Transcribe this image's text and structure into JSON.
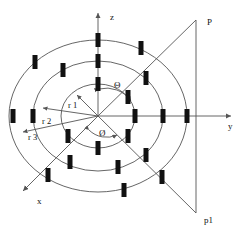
{
  "figure": {
    "background_color": "#ffffff",
    "line_color": "#555555",
    "axis_color": "#555555",
    "element_color": "#111111",
    "text_color": "#111111"
  },
  "origin": {
    "x": 98,
    "y": 116
  },
  "axes": [
    {
      "id": "z",
      "label": "z",
      "label_x": 110,
      "label_y": 17,
      "x1": 98,
      "y1": 116,
      "x2": 98,
      "y2": 12,
      "arrow": "up"
    },
    {
      "id": "y",
      "label": "y",
      "label_x": 228,
      "label_y": 128,
      "x1": 98,
      "y1": 116,
      "x2": 232,
      "y2": 116,
      "arrow": "right"
    },
    {
      "id": "x",
      "label": "x",
      "label_x": 38,
      "label_y": 203,
      "x1": 98,
      "y1": 116,
      "x2": 22,
      "y2": 192,
      "arrow": "down-left"
    }
  ],
  "rings": [
    {
      "id": "r1",
      "label": "r 1",
      "rx": 37,
      "ry": 32,
      "label_x": 68,
      "label_y": 107
    },
    {
      "id": "r2",
      "label": "r 2",
      "rx": 65,
      "ry": 55,
      "label_x": 44,
      "label_y": 123
    },
    {
      "id": "r3",
      "label": "r 3",
      "rx": 89,
      "ry": 76,
      "label_x": 30,
      "label_y": 136
    }
  ],
  "radius_arrows": [
    {
      "id": "r1-arrow",
      "x1": 98,
      "y1": 116,
      "x2": 76,
      "y2": 94
    },
    {
      "id": "r2-arrow",
      "x1": 98,
      "y1": 116,
      "x2": 42,
      "y2": 108
    },
    {
      "id": "r3-arrow",
      "x1": 98,
      "y1": 116,
      "x2": 22,
      "y2": 133
    }
  ],
  "angles": [
    {
      "id": "theta",
      "symbol": "Θ",
      "label_x": 116,
      "label_y": 85,
      "arc_x1": 98,
      "arc_y1": 90,
      "arc_x2": 133,
      "arc_y2": 100
    },
    {
      "id": "phi",
      "symbol": "Ø",
      "label_x": 101,
      "label_y": 134,
      "arc_x1": 90,
      "arc_y1": 131,
      "arc_x2": 116,
      "arc_y2": 136
    }
  ],
  "observation_point": {
    "top_label": "P",
    "bottom_label": "p1",
    "top_label_x": 209,
    "top_label_y": 23,
    "bottom_label_x": 206,
    "bottom_label_y": 221,
    "vertical_line": {
      "x": 196,
      "y_top": 20,
      "y_bottom": 213
    },
    "ray_upper": {
      "x1": 98,
      "y1": 116,
      "x2": 196,
      "y2": 20
    },
    "ray_lower": {
      "x1": 98,
      "y1": 116,
      "x2": 196,
      "y2": 213
    }
  },
  "array_elements": [
    {
      "ring": "r1",
      "x": 98,
      "y": 84
    },
    {
      "ring": "r1",
      "x": 128,
      "y": 97
    },
    {
      "ring": "r1",
      "x": 135,
      "y": 116
    },
    {
      "ring": "r1",
      "x": 128,
      "y": 136
    },
    {
      "ring": "r1",
      "x": 98,
      "y": 148
    },
    {
      "ring": "r1",
      "x": 68,
      "y": 136
    },
    {
      "ring": "r2",
      "x": 98,
      "y": 61
    },
    {
      "ring": "r2",
      "x": 146,
      "y": 78
    },
    {
      "ring": "r2",
      "x": 163,
      "y": 116
    },
    {
      "ring": "r2",
      "x": 146,
      "y": 155
    },
    {
      "ring": "r2",
      "x": 118,
      "y": 167
    },
    {
      "ring": "r2",
      "x": 70,
      "y": 162
    },
    {
      "ring": "r2",
      "x": 33,
      "y": 116
    },
    {
      "ring": "r2",
      "x": 63,
      "y": 70
    },
    {
      "ring": "r3",
      "x": 98,
      "y": 40
    },
    {
      "ring": "r3",
      "x": 141,
      "y": 48
    },
    {
      "ring": "r3",
      "x": 187,
      "y": 116
    },
    {
      "ring": "r3",
      "x": 162,
      "y": 177
    },
    {
      "ring": "r3",
      "x": 124,
      "y": 190
    },
    {
      "ring": "r3",
      "x": 48,
      "y": 175
    },
    {
      "ring": "r3",
      "x": 13,
      "y": 116
    },
    {
      "ring": "r3",
      "x": 35,
      "y": 62
    }
  ]
}
